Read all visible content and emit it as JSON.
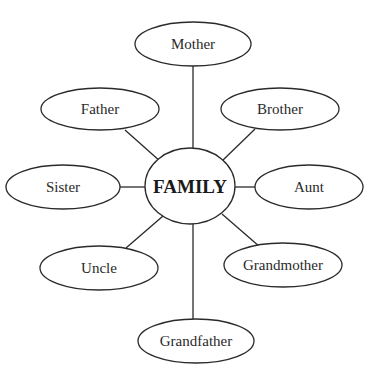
{
  "diagram": {
    "type": "mind-map",
    "center": {
      "label": "FAMILY",
      "cx": 190,
      "cy": 186,
      "rx": 45,
      "ry": 38
    },
    "nodes": [
      {
        "label": "Mother",
        "cx": 193,
        "cy": 44,
        "rx": 58,
        "ry": 22
      },
      {
        "label": "Father",
        "cx": 100,
        "cy": 109,
        "rx": 59,
        "ry": 21
      },
      {
        "label": "Brother",
        "cx": 280,
        "cy": 109,
        "rx": 59,
        "ry": 21
      },
      {
        "label": "Sister",
        "cx": 63,
        "cy": 187,
        "rx": 57,
        "ry": 22
      },
      {
        "label": "Aunt",
        "cx": 309,
        "cy": 187,
        "rx": 54,
        "ry": 22
      },
      {
        "label": "Uncle",
        "cx": 99,
        "cy": 268,
        "rx": 59,
        "ry": 22
      },
      {
        "label": "Grandmother",
        "cx": 283,
        "cy": 265,
        "rx": 59,
        "ry": 22
      },
      {
        "label": "Grandfather",
        "cx": 196,
        "cy": 341,
        "rx": 58,
        "ry": 22
      }
    ],
    "edges": [
      {
        "from": "FAMILY",
        "to": "Mother",
        "x1": 193,
        "y1": 148,
        "x2": 193,
        "y2": 66
      },
      {
        "from": "FAMILY",
        "to": "Father",
        "x1": 161,
        "y1": 162,
        "x2": 125,
        "y2": 130
      },
      {
        "from": "FAMILY",
        "to": "Brother",
        "x1": 221,
        "y1": 162,
        "x2": 255,
        "y2": 129
      },
      {
        "from": "FAMILY",
        "to": "Sister",
        "x1": 145,
        "y1": 187,
        "x2": 119,
        "y2": 187
      },
      {
        "from": "FAMILY",
        "to": "Aunt",
        "x1": 235,
        "y1": 187,
        "x2": 256,
        "y2": 187
      },
      {
        "from": "FAMILY",
        "to": "Uncle",
        "x1": 163,
        "y1": 216,
        "x2": 126,
        "y2": 248
      },
      {
        "from": "FAMILY",
        "to": "Grandmother",
        "x1": 222,
        "y1": 214,
        "x2": 260,
        "y2": 247
      },
      {
        "from": "FAMILY",
        "to": "Grandfather",
        "x1": 193,
        "y1": 224,
        "x2": 193,
        "y2": 319
      }
    ],
    "colors": {
      "stroke": "#2a2a2a",
      "fill": "#ffffff",
      "text": "#2a2a2a"
    }
  }
}
